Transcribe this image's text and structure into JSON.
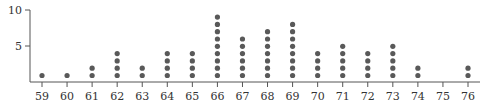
{
  "chart_data": {
    "type": "scatter",
    "subtype": "dot_plot",
    "title": "",
    "xlabel": "",
    "ylabel": "",
    "categories": [
      "59",
      "60",
      "61",
      "62",
      "63",
      "64",
      "65",
      "66",
      "67",
      "68",
      "69",
      "70",
      "71",
      "72",
      "73",
      "74",
      "75",
      "76"
    ],
    "values": [
      1,
      1,
      2,
      4,
      2,
      4,
      4,
      9,
      6,
      7,
      8,
      4,
      5,
      4,
      5,
      2,
      0,
      2
    ],
    "y_ticks": [
      "5",
      "10"
    ],
    "ylim": [
      0,
      10
    ],
    "grid": false,
    "legend": null,
    "colors": {
      "dot": "#595959",
      "axis": "#555555",
      "text": "#333333"
    }
  }
}
